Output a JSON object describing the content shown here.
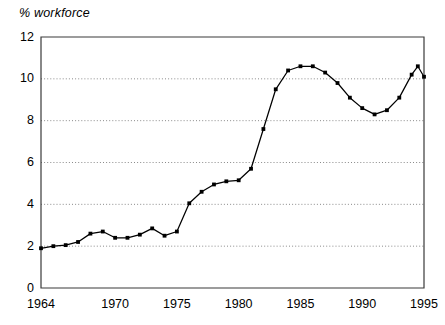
{
  "chart_data": {
    "type": "line",
    "title": "",
    "ylabel": "% workforce",
    "xlabel": "",
    "ylim": [
      0,
      12
    ],
    "xlim": [
      1964,
      1995
    ],
    "grid": true,
    "grid_axis": "y",
    "grid_style": "dotted",
    "legend": null,
    "legend_position": "none",
    "marker": "square",
    "yticks": [
      0,
      2,
      4,
      6,
      8,
      10,
      12
    ],
    "ytick_labels": [
      "0",
      "2",
      "4",
      "6",
      "8",
      "10",
      "12"
    ],
    "xticks": [
      1964,
      1970,
      1975,
      1980,
      1985,
      1990,
      1995
    ],
    "xtick_labels": [
      "1964",
      "1970",
      "1975",
      "1980",
      "1985",
      "1990",
      "1995"
    ],
    "series": [
      {
        "name": "% workforce",
        "color": "#000000",
        "x": [
          1964,
          1965,
          1966,
          1967,
          1968,
          1969,
          1970,
          1971,
          1972,
          1973,
          1974,
          1975,
          1976,
          1977,
          1978,
          1979,
          1980,
          1981,
          1982,
          1983,
          1984,
          1985,
          1986,
          1987,
          1988,
          1989,
          1990,
          1991,
          1992,
          1993,
          1994,
          1994.5,
          1995
        ],
        "values": [
          1.9,
          2.0,
          2.05,
          2.2,
          2.6,
          2.7,
          2.4,
          2.4,
          2.55,
          2.85,
          2.5,
          2.7,
          4.05,
          4.6,
          4.95,
          5.1,
          5.15,
          5.7,
          7.6,
          9.5,
          10.4,
          10.6,
          10.6,
          10.3,
          9.8,
          9.1,
          8.6,
          8.3,
          8.5,
          9.1,
          10.2,
          10.6,
          10.1
        ]
      }
    ],
    "colors": {
      "line": "#000000",
      "marker": "#000000",
      "grid": "#8a8a8a",
      "frame": "#3a3a3a",
      "background": "#ffffff",
      "text": "#000000"
    }
  }
}
